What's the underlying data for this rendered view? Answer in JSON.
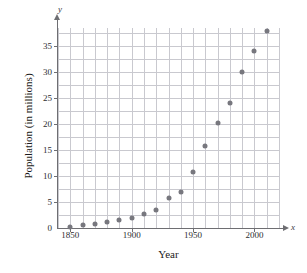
{
  "chart_data": {
    "type": "scatter",
    "title": "",
    "xlabel": "Year",
    "ylabel": "Population (in millions)",
    "x_axis_letter": "x",
    "y_axis_letter": "y",
    "xlim": [
      1840,
      2020
    ],
    "ylim": [
      0,
      38.5
    ],
    "grid": true,
    "legend": "none",
    "x_ticks": [
      1850,
      1900,
      1950,
      2000
    ],
    "x_tick_labels": [
      "1850",
      "1900",
      "1950",
      "2000"
    ],
    "y_ticks": [
      0,
      5,
      10,
      15,
      20,
      25,
      30,
      35
    ],
    "y_tick_labels": [
      "0",
      "5",
      "10",
      "15",
      "20",
      "25",
      "30",
      "35"
    ],
    "x_minor_step": 10,
    "y_minor_step": 2.5,
    "marker_color": "#77777e",
    "grid_color": "#c9c9cf",
    "axis_color": "#6e6e72",
    "x": [
      1850,
      1860,
      1870,
      1880,
      1890,
      1900,
      1910,
      1920,
      1930,
      1940,
      1950,
      1960,
      1970,
      1980,
      1990,
      2000,
      2010
    ],
    "values": [
      0.2,
      0.5,
      0.8,
      1.1,
      1.5,
      1.9,
      2.6,
      3.5,
      5.8,
      7.0,
      10.8,
      15.8,
      20.2,
      24.0,
      30.0,
      34.0,
      38.0
    ],
    "points": [
      {
        "x": 1850,
        "y": 0.2
      },
      {
        "x": 1860,
        "y": 0.5
      },
      {
        "x": 1870,
        "y": 0.8
      },
      {
        "x": 1880,
        "y": 1.1
      },
      {
        "x": 1890,
        "y": 1.5
      },
      {
        "x": 1900,
        "y": 1.9
      },
      {
        "x": 1910,
        "y": 2.6
      },
      {
        "x": 1920,
        "y": 3.5
      },
      {
        "x": 1930,
        "y": 5.8
      },
      {
        "x": 1940,
        "y": 7.0
      },
      {
        "x": 1950,
        "y": 10.8
      },
      {
        "x": 1960,
        "y": 15.8
      },
      {
        "x": 1970,
        "y": 20.2
      },
      {
        "x": 1980,
        "y": 24.0
      },
      {
        "x": 1990,
        "y": 30.0
      },
      {
        "x": 2000,
        "y": 34.0
      },
      {
        "x": 2010,
        "y": 38.0
      }
    ]
  }
}
